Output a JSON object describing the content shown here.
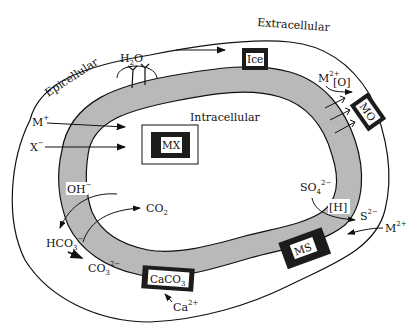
{
  "regions": {
    "extracellular": "Extracellular",
    "epicellular": "Epicellular",
    "intracellular": "Intracellular"
  },
  "deposits": {
    "ice": "Ice",
    "mo": "MO",
    "mx": "MX",
    "ms": "MS",
    "caco3_base": "CaCO",
    "caco3_sub": "3"
  },
  "species": {
    "h2o_h": "H",
    "h2o_sub": "2",
    "h2o_o": "O",
    "m2_ox": "M",
    "m2_ox_sup": "2+",
    "oxidant": "[O]",
    "m_plus": "M",
    "m_plus_sup": "+",
    "x_minus": "X",
    "x_minus_sup": "−",
    "oh": "OH",
    "oh_sup": "−",
    "co2": "CO",
    "co2_sub": "2",
    "hco3": "HCO",
    "hco3_sub": "3",
    "hco3_sup": "−",
    "co3": "CO",
    "co3_sub": "3",
    "co3_sup": "2−",
    "ca": "Ca",
    "ca_sup": "2+",
    "so4": "SO",
    "so4_sub": "4",
    "so4_sup": "2−",
    "reductant": "[H]",
    "s": "S",
    "s_sup": "2−",
    "m2_s": "M",
    "m2_s_sup": "2+"
  },
  "colors": {
    "membrane_fill": "#b9b9b9",
    "deposit_dark": "#1c1c1c",
    "line": "#111111"
  }
}
